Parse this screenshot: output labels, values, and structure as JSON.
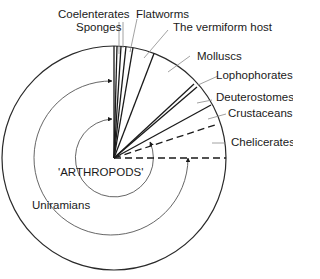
{
  "diagram": {
    "center_label": "'ARTHROPODS'",
    "ring_label": "Uniramians",
    "groups": [
      {
        "name": "Coelenterates"
      },
      {
        "name": "Sponges"
      },
      {
        "name": "Flatworms"
      },
      {
        "name": "The vermiform host"
      },
      {
        "name": "Molluscs"
      },
      {
        "name": "Lophophorates"
      },
      {
        "name": "Deuterostomes"
      },
      {
        "name": "Crustaceans"
      },
      {
        "name": "Chelicerates"
      }
    ],
    "colors": {
      "line": "#1a1a1a",
      "leader": "#9a9a9a",
      "background": "#ffffff"
    }
  }
}
